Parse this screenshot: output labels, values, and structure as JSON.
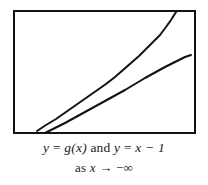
{
  "figure": {
    "background_color": "#ffffff",
    "frame": {
      "color": "#121212",
      "border_width_px": 2,
      "x": 13,
      "y": 10,
      "width": 183,
      "height": 124
    },
    "caption": {
      "line1": "y = g(x) and y = x − 1",
      "line1_parts": {
        "y1": "y",
        "eq1": "=",
        "g_of_x": "g(x)",
        "and": "and",
        "y2": "y",
        "eq2": "=",
        "x_minus_1": "x − 1"
      },
      "line2": "as x → −∞",
      "line2_parts": {
        "as": "as",
        "x": "x",
        "arrow": "→",
        "limit": "−∞"
      }
    }
  },
  "chart_data": {
    "type": "line",
    "title": "",
    "subtitle": "",
    "xlabel": "",
    "ylabel": "",
    "grid": false,
    "legend": false,
    "axes_visible": false,
    "tick_labels": [],
    "annotations": [
      "y = g(x) and y = x − 1",
      "as x → −∞"
    ],
    "xlim": [
      0,
      183
    ],
    "ylim": [
      0,
      124
    ],
    "series": [
      {
        "name": "y = g(x)",
        "style": "solid",
        "color": "#121212",
        "width_px": 2,
        "points": [
          [
            24,
            121
          ],
          [
            33,
            115
          ],
          [
            43,
            109
          ],
          [
            53,
            102
          ],
          [
            63,
            95
          ],
          [
            73,
            88
          ],
          [
            83,
            81
          ],
          [
            93,
            74
          ],
          [
            102,
            67
          ],
          [
            110,
            60
          ],
          [
            118,
            53
          ],
          [
            126,
            46
          ],
          [
            133,
            39
          ],
          [
            140,
            32
          ],
          [
            147,
            25
          ],
          [
            153,
            17
          ],
          [
            158,
            10
          ],
          [
            163,
            2
          ],
          [
            165,
            0
          ]
        ]
      },
      {
        "name": "y = x − 1",
        "style": "solid",
        "color": "#121212",
        "width_px": 2,
        "points": [
          [
            32,
            123
          ],
          [
            52,
            113
          ],
          [
            72,
            102
          ],
          [
            92,
            91
          ],
          [
            112,
            80
          ],
          [
            132,
            68
          ],
          [
            152,
            57
          ],
          [
            172,
            47
          ],
          [
            178,
            45
          ]
        ]
      }
    ]
  }
}
